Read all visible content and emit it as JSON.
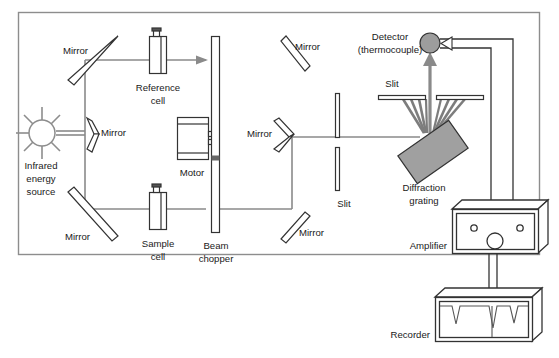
{
  "diagram": {
    "domain": "Diagram",
    "background_color": "#ffffff",
    "border_color": "#8d8d8d",
    "ink_color": "#333333",
    "beam_color": "#8a8a8a",
    "fill_gray": "#9d9d9d",
    "panel": {
      "x": 18,
      "y": 12,
      "width": 522,
      "height": 243
    }
  },
  "labels": {
    "mirror_top_left": "Mirror",
    "mirror_source": "Mirror",
    "mirror_bottom_left": "Mirror",
    "mirror_top_right": "Mirror",
    "mirror_mid_right": "Mirror",
    "mirror_bottom_right": "Mirror",
    "infrared_source_line1": "Infrared",
    "infrared_source_line2": "energy",
    "infrared_source_line3": "source",
    "reference_cell_line1": "Reference",
    "reference_cell_line2": "cell",
    "sample_cell_line1": "Sample",
    "sample_cell_line2": "cell",
    "motor": "Motor",
    "beam_chopper_line1": "Beam",
    "beam_chopper_line2": "chopper",
    "slit_upper": "Slit",
    "slit_lower": "Slit",
    "detector_line1": "Detector",
    "detector_line2": "(thermocouple)",
    "diffraction_grating_line1": "Diffraction",
    "diffraction_grating_line2": "grating",
    "amplifier": "Amplifier",
    "recorder": "Recorder"
  },
  "components": {
    "infrared_source": {
      "cx": 42,
      "cy": 133,
      "r": 13,
      "ray_count": 8,
      "ray_length": 13
    },
    "detector": {
      "cx": 430,
      "cy": 43,
      "r": 10,
      "fill": "#9d9d9d"
    },
    "diffraction_grating": {
      "cx": 433,
      "cy": 152,
      "width": 62,
      "height": 34,
      "rotation": -35,
      "fill": "#a0a0a0"
    },
    "beam_chopper": {
      "x": 211,
      "y": 36,
      "width": 8,
      "height": 196
    },
    "motor": {
      "x": 177,
      "y": 117,
      "width": 31,
      "height": 42
    },
    "reference_cell": {
      "x": 150,
      "y": 36,
      "width": 16,
      "height": 37
    },
    "sample_cell": {
      "x": 150,
      "y": 192,
      "width": 16,
      "height": 37
    },
    "slit_upper": {
      "y": 97,
      "left_x1": 378,
      "left_x2": 425,
      "right_x1": 437,
      "right_x2": 484
    },
    "slit_lower": {
      "x": 337,
      "top_y1": 93,
      "top_y2": 137,
      "bottom_y1": 147,
      "bottom_y2": 190
    },
    "amplifier": {
      "x": 452,
      "y": 209,
      "width": 86,
      "height": 44,
      "knob_count": 3
    },
    "recorder": {
      "x": 435,
      "y": 297,
      "width": 97,
      "height": 44,
      "peak_count": 3
    },
    "diffraction_fan_rays": 8
  },
  "beam_path": {
    "source_to_splitter": "horizontal double line from source to the splitting mirror",
    "upper_branch": "through reference cell to beam chopper",
    "lower_branch": "through sample cell to beam chopper",
    "combined": "to diffraction grating via slit, then to detector"
  },
  "wiring": {
    "detector_to_amplifier_wires": 2,
    "amplifier_to_recorder_wires": 2
  }
}
